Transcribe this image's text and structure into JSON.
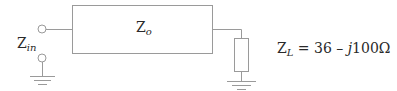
{
  "diagram": {
    "type": "transmission-line-circuit",
    "line": {
      "label_main": "Z",
      "label_sub": "o"
    },
    "input": {
      "label_main": "Z",
      "label_sub": "in"
    },
    "load": {
      "label_main": "Z",
      "label_sub": "L",
      "equals": " = 36 – ",
      "imag_unit": "j",
      "value_tail": "100Ω"
    },
    "colors": {
      "stroke": "#9a9a9a",
      "text": "#2a2a2a",
      "background": "#ffffff"
    }
  }
}
